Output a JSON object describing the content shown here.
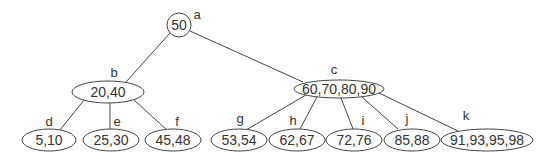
{
  "diagram": {
    "type": "tree",
    "nodes": [
      {
        "id": "a",
        "label": "a",
        "keys": "50",
        "shape": "circle",
        "cx": 179,
        "cy": 25,
        "rx": 12,
        "ry": 12,
        "lx": 197,
        "ly": 14
      },
      {
        "id": "b",
        "label": "b",
        "keys": "20,40",
        "shape": "ellipse",
        "cx": 108,
        "cy": 92,
        "rx": 36,
        "ry": 11,
        "lx": 114,
        "ly": 72
      },
      {
        "id": "c",
        "label": "c",
        "keys": "60,70,80,90",
        "shape": "ellipse",
        "cx": 339,
        "cy": 89,
        "rx": 45,
        "ry": 9,
        "lx": 334,
        "ly": 69
      },
      {
        "id": "d",
        "label": "d",
        "keys": "5,10",
        "shape": "ellipse",
        "cx": 49,
        "cy": 140,
        "rx": 27,
        "ry": 11,
        "lx": 49,
        "ly": 121
      },
      {
        "id": "e",
        "label": "e",
        "keys": "25,30",
        "shape": "ellipse",
        "cx": 111,
        "cy": 140,
        "rx": 28,
        "ry": 11,
        "lx": 117,
        "ly": 121
      },
      {
        "id": "f",
        "label": "f",
        "keys": "45,48",
        "shape": "ellipse",
        "cx": 173,
        "cy": 140,
        "rx": 28,
        "ry": 11,
        "lx": 177,
        "ly": 121
      },
      {
        "id": "g",
        "label": "g",
        "keys": "53,54",
        "shape": "ellipse",
        "cx": 239,
        "cy": 140,
        "rx": 28,
        "ry": 11,
        "lx": 240,
        "ly": 118
      },
      {
        "id": "h",
        "label": "h",
        "keys": "62,67",
        "shape": "ellipse",
        "cx": 297,
        "cy": 140,
        "rx": 28,
        "ry": 11,
        "lx": 293,
        "ly": 120
      },
      {
        "id": "i",
        "label": "i",
        "keys": "72,76",
        "shape": "ellipse",
        "cx": 354,
        "cy": 140,
        "rx": 28,
        "ry": 11,
        "lx": 363,
        "ly": 120
      },
      {
        "id": "j",
        "label": "j",
        "keys": "85,88",
        "shape": "ellipse",
        "cx": 412,
        "cy": 140,
        "rx": 28,
        "ry": 11,
        "lx": 407,
        "ly": 118
      },
      {
        "id": "k",
        "label": "k",
        "keys": "91,93,95,98",
        "shape": "ellipse",
        "cx": 487,
        "cy": 140,
        "rx": 46,
        "ry": 11,
        "lx": 466,
        "ly": 115
      }
    ],
    "edges": [
      {
        "from": "a",
        "to": "b",
        "x1": 170,
        "y1": 33,
        "x2": 126,
        "y2": 82
      },
      {
        "from": "a",
        "to": "c",
        "x1": 190,
        "y1": 31,
        "x2": 303,
        "y2": 82
      },
      {
        "from": "b",
        "to": "d",
        "x1": 84,
        "y1": 100,
        "x2": 60,
        "y2": 130
      },
      {
        "from": "b",
        "to": "e",
        "x1": 110,
        "y1": 103,
        "x2": 110,
        "y2": 129
      },
      {
        "from": "b",
        "to": "f",
        "x1": 134,
        "y1": 100,
        "x2": 167,
        "y2": 130
      },
      {
        "from": "c",
        "to": "g",
        "x1": 306,
        "y1": 95,
        "x2": 246,
        "y2": 130
      },
      {
        "from": "c",
        "to": "h",
        "x1": 317,
        "y1": 97,
        "x2": 300,
        "y2": 129
      },
      {
        "from": "c",
        "to": "i",
        "x1": 341,
        "y1": 98,
        "x2": 353,
        "y2": 129
      },
      {
        "from": "c",
        "to": "j",
        "x1": 362,
        "y1": 97,
        "x2": 398,
        "y2": 129
      },
      {
        "from": "c",
        "to": "k",
        "x1": 379,
        "y1": 93,
        "x2": 458,
        "y2": 131
      }
    ],
    "colors": {
      "stroke": "#444444",
      "text": "#333333",
      "background": "#ffffff"
    }
  }
}
